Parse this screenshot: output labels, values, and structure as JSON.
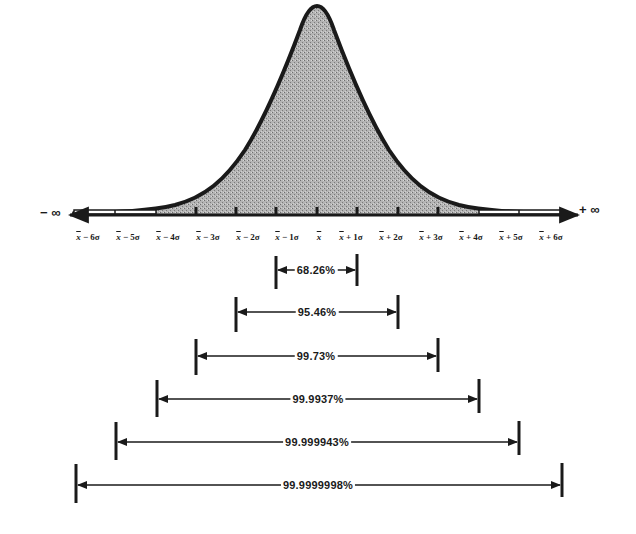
{
  "diagram": {
    "title": "",
    "axis": {
      "left_label": "− ∞",
      "right_label": "+ ∞",
      "ticks": [
        {
          "mean": "x",
          "op": " − 6σ"
        },
        {
          "mean": "x",
          "op": " − 5σ"
        },
        {
          "mean": "x",
          "op": " − 4σ"
        },
        {
          "mean": "x",
          "op": " − 3σ"
        },
        {
          "mean": "x",
          "op": " − 2σ"
        },
        {
          "mean": "x",
          "op": " − 1σ"
        },
        {
          "mean": "x",
          "op": ""
        },
        {
          "mean": "x",
          "op": " + 1σ"
        },
        {
          "mean": "x",
          "op": " + 2σ"
        },
        {
          "mean": "x",
          "op": " + 3σ"
        },
        {
          "mean": "x",
          "op": " + 4σ"
        },
        {
          "mean": "x",
          "op": " + 5σ"
        },
        {
          "mean": "x",
          "op": " + 6σ"
        }
      ]
    },
    "ranges": [
      {
        "label": "68.26%",
        "sigma": 1
      },
      {
        "label": "95.46%",
        "sigma": 2
      },
      {
        "label": "99.73%",
        "sigma": 3
      },
      {
        "label": "99.9937%",
        "sigma": 4
      },
      {
        "label": "99.999943%",
        "sigma": 5
      },
      {
        "label": "99.9999998%",
        "sigma": 6
      }
    ],
    "colors": {
      "ink": "#1a1a1a",
      "fill": "#a8a8a8",
      "background": "#ffffff"
    }
  }
}
